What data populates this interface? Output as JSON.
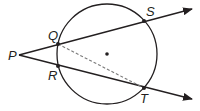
{
  "diagram": {
    "type": "circle-secant-geometry",
    "colors": {
      "stroke": "#231f20",
      "dashed": "#7a7a7a",
      "background": "#ffffff"
    },
    "circle": {
      "center": [
        107,
        54
      ],
      "radius": 50,
      "center_dot": true
    },
    "points": {
      "P": {
        "label": "P",
        "x": 19,
        "y": 55
      },
      "Q": {
        "label": "Q",
        "x": 58,
        "y": 44
      },
      "R": {
        "label": "R",
        "x": 58,
        "y": 66
      },
      "S": {
        "label": "S",
        "x": 144,
        "y": 21
      },
      "T": {
        "label": "T",
        "x": 144,
        "y": 88
      }
    },
    "rays": [
      {
        "name": "ray-PS",
        "from": "P",
        "through": [
          "Q",
          "S"
        ],
        "end": [
          192,
          9
        ]
      },
      {
        "name": "ray-PT",
        "from": "P",
        "through": [
          "R",
          "T"
        ],
        "end": [
          192,
          99
        ]
      }
    ],
    "segments": [
      {
        "name": "segment-QT",
        "from": "Q",
        "to": "T",
        "style": "dashed"
      }
    ]
  }
}
